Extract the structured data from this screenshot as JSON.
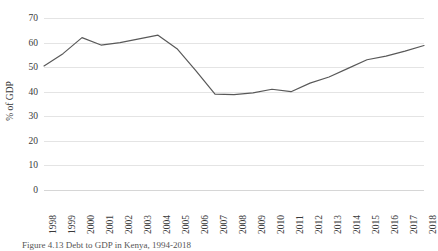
{
  "chart_data": {
    "type": "line",
    "title": "",
    "xlabel": "",
    "ylabel": "% of GDP",
    "ylim": [
      0,
      70
    ],
    "yticks": [
      0,
      10,
      20,
      30,
      40,
      50,
      60,
      70
    ],
    "grid": true,
    "legend": false,
    "line_color": "#595959",
    "categories": [
      "1998",
      "1999",
      "2000",
      "2001",
      "2002",
      "2003",
      "2004",
      "2005",
      "2006",
      "2007",
      "2008",
      "2009",
      "2010",
      "2011",
      "2012",
      "2013",
      "2014",
      "2015",
      "2016",
      "2017",
      "2018"
    ],
    "values": [
      50.5,
      55.5,
      62.0,
      59.0,
      60.0,
      61.5,
      63.0,
      57.5,
      48.5,
      39.0,
      38.8,
      39.5,
      41.0,
      40.0,
      43.5,
      46.0,
      49.5,
      53.0,
      54.5,
      56.5,
      58.8
    ]
  },
  "caption": {
    "text": "Figure 4.13 Debt to GDP in Kenya, 1994-2018"
  }
}
